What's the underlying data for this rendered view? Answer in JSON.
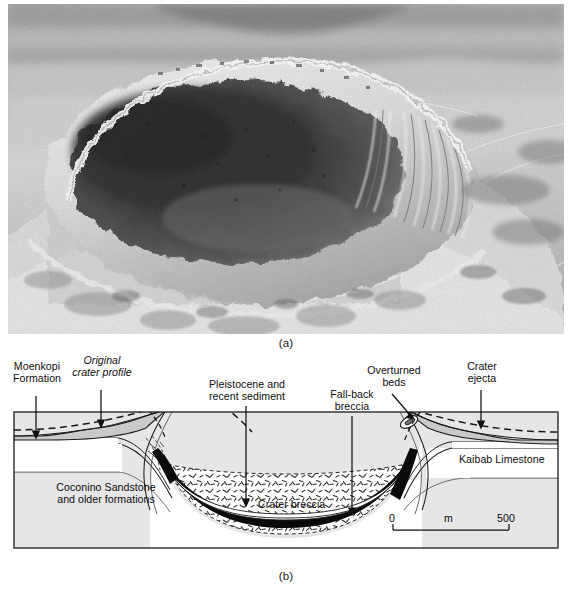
{
  "figure": {
    "panels": [
      {
        "id": "a",
        "caption": "(a)",
        "type": "aerial-photograph",
        "subject": "Oblique aerial photograph of Meteor Crater (Barringer Crater), Arizona"
      },
      {
        "id": "b",
        "caption": "(b)",
        "type": "geologic-cross-section",
        "subject": "Geologic cross section through the crater"
      }
    ]
  },
  "cross_section": {
    "labels": {
      "moenkopi": "Moenkopi\nFormation",
      "original_profile": "Original\ncrater profile",
      "pleistocene": "Pleistocene and\nrecent sediment",
      "fallback": "Fall-back\nbreccia",
      "overturned": "Overturned\nbeds",
      "ejecta": "Crater\nejecta",
      "kaibab": "Kaibab Limestone",
      "coconino": "Coconino Sandstone\nand older formations",
      "breccia": "Crater breccia"
    },
    "scale_bar": {
      "min": "0",
      "unit": "m",
      "max": "500"
    },
    "colors": {
      "ink": "#111111",
      "fill_light_gray": "#e4e4e4",
      "fill_mid_gray": "#cfcfcf",
      "fill_white": "#ffffff",
      "fallback_black": "#0a0a0a",
      "dashed_profile": "#1a1a1a"
    }
  }
}
